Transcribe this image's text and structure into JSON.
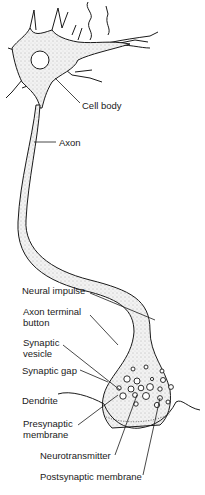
{
  "diagram": {
    "labels": {
      "cell_body": "Cell body",
      "axon": "Axon",
      "neural_impulse": "Neural impulse",
      "axon_terminal_button": "Axon terminal button",
      "synaptic_vesicle": "Synaptic vesicle",
      "synaptic_gap": "Synaptic gap",
      "dendrite": "Dendrite",
      "presynaptic_membrane": "Presynaptic membrane",
      "neurotransmitter": "Neurotransmitter",
      "postsynaptic_membrane": "Postsynaptic membrane"
    },
    "colors": {
      "ink": "#1a1a1a",
      "fill": "#e9e9e9",
      "background": "#ffffff"
    }
  }
}
